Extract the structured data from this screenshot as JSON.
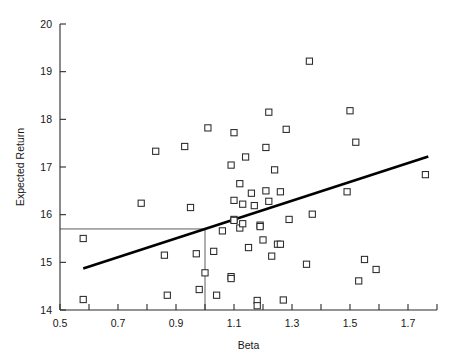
{
  "chart_data": {
    "type": "scatter",
    "title": "",
    "xlabel": "Beta",
    "ylabel": "Expected Return",
    "xlim": [
      0.5,
      1.8
    ],
    "ylim": [
      14,
      20
    ],
    "grid": false,
    "legend": "none",
    "x_ticks_major": [
      "0.5",
      "0.7",
      "0.9",
      "1.1",
      "1.3",
      "1.5",
      "1.7"
    ],
    "x_ticks_major_values": [
      0.5,
      0.7,
      0.9,
      1.1,
      1.3,
      1.5,
      1.7
    ],
    "x_ticks_minor_values": [
      0.6,
      0.8,
      1.0,
      1.2,
      1.4,
      1.6,
      1.8
    ],
    "y_ticks": [
      "14",
      "15",
      "16",
      "17",
      "18",
      "19",
      "20"
    ],
    "y_ticks_values": [
      14,
      15,
      16,
      17,
      18,
      19,
      20
    ],
    "marker_style": "open-square",
    "points": [
      {
        "x": 0.58,
        "y": 15.5
      },
      {
        "x": 0.58,
        "y": 14.22
      },
      {
        "x": 0.78,
        "y": 16.24
      },
      {
        "x": 0.83,
        "y": 17.33
      },
      {
        "x": 0.86,
        "y": 15.15
      },
      {
        "x": 0.87,
        "y": 14.31
      },
      {
        "x": 0.93,
        "y": 17.43
      },
      {
        "x": 0.95,
        "y": 16.15
      },
      {
        "x": 0.97,
        "y": 15.18
      },
      {
        "x": 0.98,
        "y": 14.43
      },
      {
        "x": 1.0,
        "y": 14.78
      },
      {
        "x": 1.01,
        "y": 17.82
      },
      {
        "x": 1.03,
        "y": 15.23
      },
      {
        "x": 1.04,
        "y": 14.31
      },
      {
        "x": 1.06,
        "y": 15.66
      },
      {
        "x": 1.09,
        "y": 17.04
      },
      {
        "x": 1.09,
        "y": 14.7
      },
      {
        "x": 1.09,
        "y": 14.66
      },
      {
        "x": 1.1,
        "y": 17.72
      },
      {
        "x": 1.1,
        "y": 15.9
      },
      {
        "x": 1.1,
        "y": 15.88
      },
      {
        "x": 1.1,
        "y": 16.3
      },
      {
        "x": 1.12,
        "y": 15.72
      },
      {
        "x": 1.12,
        "y": 16.65
      },
      {
        "x": 1.13,
        "y": 15.81
      },
      {
        "x": 1.13,
        "y": 16.22
      },
      {
        "x": 1.14,
        "y": 17.21
      },
      {
        "x": 1.15,
        "y": 15.31
      },
      {
        "x": 1.16,
        "y": 16.45
      },
      {
        "x": 1.17,
        "y": 16.19
      },
      {
        "x": 1.18,
        "y": 14.2
      },
      {
        "x": 1.18,
        "y": 14.09
      },
      {
        "x": 1.19,
        "y": 15.78
      },
      {
        "x": 1.19,
        "y": 15.75
      },
      {
        "x": 1.2,
        "y": 15.47
      },
      {
        "x": 1.21,
        "y": 16.5
      },
      {
        "x": 1.21,
        "y": 17.41
      },
      {
        "x": 1.22,
        "y": 18.15
      },
      {
        "x": 1.22,
        "y": 16.28
      },
      {
        "x": 1.23,
        "y": 15.13
      },
      {
        "x": 1.24,
        "y": 16.94
      },
      {
        "x": 1.25,
        "y": 15.38
      },
      {
        "x": 1.26,
        "y": 15.38
      },
      {
        "x": 1.26,
        "y": 16.48
      },
      {
        "x": 1.27,
        "y": 14.21
      },
      {
        "x": 1.28,
        "y": 17.79
      },
      {
        "x": 1.29,
        "y": 15.9
      },
      {
        "x": 1.35,
        "y": 14.96
      },
      {
        "x": 1.36,
        "y": 19.22
      },
      {
        "x": 1.37,
        "y": 16.01
      },
      {
        "x": 1.49,
        "y": 16.48
      },
      {
        "x": 1.5,
        "y": 18.18
      },
      {
        "x": 1.52,
        "y": 17.52
      },
      {
        "x": 1.53,
        "y": 14.61
      },
      {
        "x": 1.55,
        "y": 15.06
      },
      {
        "x": 1.59,
        "y": 14.85
      },
      {
        "x": 1.76,
        "y": 16.84
      }
    ],
    "trendline": {
      "x0": 0.58,
      "y0": 14.87,
      "x1": 1.77,
      "y1": 17.22,
      "label": "fitted-regression-line"
    },
    "reference_lines": [
      {
        "orientation": "horizontal",
        "value": 15.7,
        "x_from": 0.5,
        "x_to": 1.0,
        "label": "market-expected-return"
      },
      {
        "orientation": "vertical",
        "value": 1.0,
        "y_from": 14.0,
        "y_to": 15.7,
        "label": "market-beta"
      }
    ]
  }
}
